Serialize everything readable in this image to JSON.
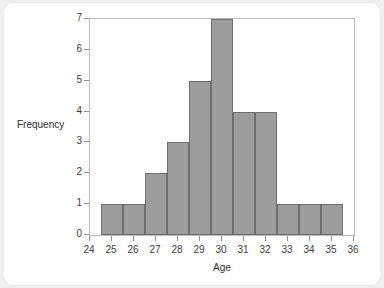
{
  "chart_data": {
    "type": "bar",
    "title": "",
    "subtitle": "",
    "xlabel": "Age",
    "ylabel": "Frequency",
    "categories": [
      25,
      26,
      27,
      28,
      29,
      30,
      31,
      32,
      33,
      34,
      35
    ],
    "values": [
      1,
      1,
      2,
      3,
      5,
      7,
      4,
      4,
      1,
      1,
      1
    ],
    "bin_edges": [
      24.5,
      25.5,
      26.5,
      27.5,
      28.5,
      29.5,
      30.5,
      31.5,
      32.5,
      33.5,
      34.5,
      35.5
    ],
    "bin_width": 1,
    "total_count": 31,
    "xlim": [
      24,
      36
    ],
    "ylim": [
      0,
      7
    ],
    "xticks": [
      24,
      25,
      26,
      27,
      28,
      29,
      30,
      31,
      32,
      33,
      34,
      35,
      36
    ],
    "xtick_labels": [
      "24",
      "25",
      "26",
      "27",
      "28",
      "29",
      "30",
      "31",
      "32",
      "33",
      "34",
      "35",
      "36"
    ],
    "yticks": [
      0,
      1,
      2,
      3,
      4,
      5,
      6,
      7
    ],
    "ytick_labels": [
      "0",
      "1",
      "2",
      "3",
      "4",
      "5",
      "6",
      "7"
    ],
    "grid": false,
    "legend": false,
    "legend_position": "none",
    "annotations": [],
    "colors": {
      "bar_fill": "#9d9d9d",
      "bar_edge": "#6e6e6e",
      "plot_border": "#b9b9b9",
      "axis_text": "#3c3c3c",
      "label_text": "#2e2e2e",
      "card_background": "#ffffff",
      "page_background": "#f0f0f0"
    }
  }
}
